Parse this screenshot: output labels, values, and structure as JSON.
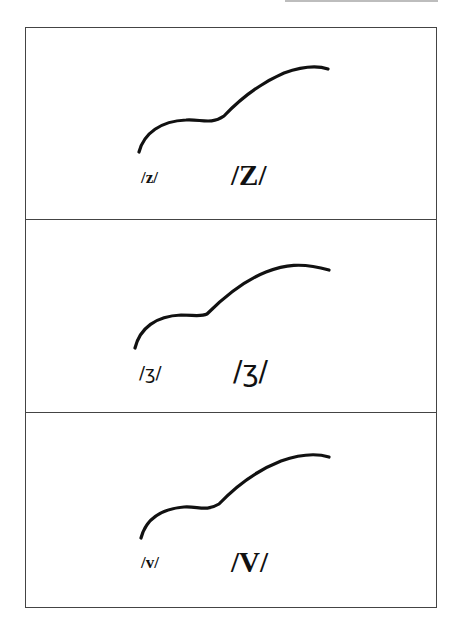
{
  "diagram": {
    "panels": [
      {
        "id": "z",
        "label_small": "/z/",
        "label_large": "/Z/"
      },
      {
        "id": "zh",
        "label_small": "/ʒ/",
        "label_large": "/ʒ/"
      },
      {
        "id": "v",
        "label_small": "/v/",
        "label_large": "/V/"
      }
    ],
    "colors": {
      "stroke": "#111111",
      "border": "#444444",
      "background": "#ffffff"
    }
  }
}
